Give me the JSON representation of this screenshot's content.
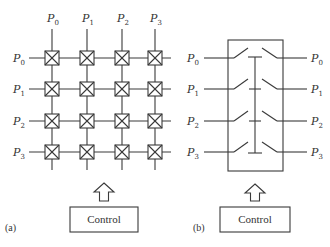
{
  "figure": {
    "panel_a": {
      "caption": "(a)",
      "title": "Crossbar switch",
      "column_labels": [
        {
          "base": "P",
          "sub": "0"
        },
        {
          "base": "P",
          "sub": "1"
        },
        {
          "base": "P",
          "sub": "2"
        },
        {
          "base": "P",
          "sub": "3"
        }
      ],
      "row_labels": [
        {
          "base": "P",
          "sub": "0"
        },
        {
          "base": "P",
          "sub": "1"
        },
        {
          "base": "P",
          "sub": "2"
        },
        {
          "base": "P",
          "sub": "3"
        }
      ],
      "control_label": "Control",
      "switch_icon": "crossed-box-icon"
    },
    "panel_b": {
      "caption": "(b)",
      "title": "Bus switch",
      "left_labels": [
        {
          "base": "P",
          "sub": "0"
        },
        {
          "base": "P",
          "sub": "1"
        },
        {
          "base": "P",
          "sub": "2"
        },
        {
          "base": "P",
          "sub": "3"
        }
      ],
      "right_labels": [
        {
          "base": "P",
          "sub": "0"
        },
        {
          "base": "P",
          "sub": "1"
        },
        {
          "base": "P",
          "sub": "2"
        },
        {
          "base": "P",
          "sub": "3"
        }
      ],
      "control_label": "Control"
    }
  },
  "colors": {
    "stroke": "#3a3a3a",
    "text": "#333333",
    "background": "#ffffff"
  }
}
